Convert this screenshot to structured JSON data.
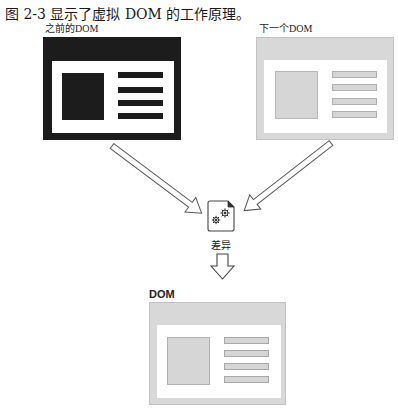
{
  "caption": "图 2-3 显示了虚拟 DOM 的工作原理。",
  "diagram": {
    "previous_dom": {
      "label": "之前的DOM",
      "style": "dark",
      "frame_color": "#1c1c1c",
      "content_color": "#1c1c1c",
      "text_lines": 4
    },
    "next_dom": {
      "label": "下一个DOM",
      "style": "light",
      "frame_color": "#d6d6d6",
      "content_color": "#d6d6d6",
      "text_lines": 4
    },
    "diff": {
      "label": "差异",
      "icon": "gears-document-icon"
    },
    "result_dom": {
      "label": "DOM",
      "style": "light",
      "frame_color": "#d6d6d6",
      "content_color": "#d6d6d6",
      "text_lines": 4
    },
    "arrows": [
      {
        "from": "previous_dom",
        "to": "diff",
        "direction": "down-right"
      },
      {
        "from": "next_dom",
        "to": "diff",
        "direction": "down-left"
      },
      {
        "from": "diff",
        "to": "result_dom",
        "direction": "down"
      }
    ]
  }
}
